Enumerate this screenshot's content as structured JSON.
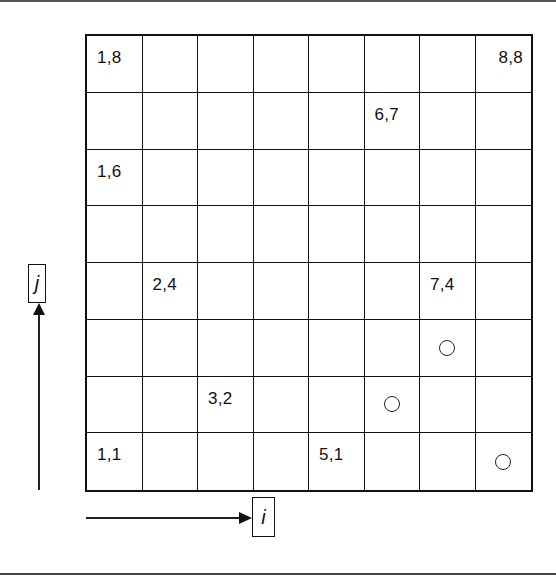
{
  "diagram": {
    "grid": {
      "columns": 8,
      "rows": 8
    },
    "axes": {
      "i": {
        "label": "i",
        "direction": "right"
      },
      "j": {
        "label": "j",
        "direction": "up"
      }
    },
    "labeled_cells": [
      {
        "i": 1,
        "j": 8,
        "text": "1,8"
      },
      {
        "i": 8,
        "j": 8,
        "text": "8,8"
      },
      {
        "i": 6,
        "j": 7,
        "text": "6,7"
      },
      {
        "i": 1,
        "j": 6,
        "text": "1,6"
      },
      {
        "i": 2,
        "j": 4,
        "text": "2,4"
      },
      {
        "i": 7,
        "j": 4,
        "text": "7,4"
      },
      {
        "i": 3,
        "j": 2,
        "text": "3,2"
      },
      {
        "i": 1,
        "j": 1,
        "text": "1,1"
      },
      {
        "i": 5,
        "j": 1,
        "text": "5,1"
      }
    ],
    "circle_markers": [
      {
        "i": 7,
        "j": 3,
        "icon": "circle-icon"
      },
      {
        "i": 6,
        "j": 2,
        "icon": "circle-icon"
      },
      {
        "i": 8,
        "j": 1,
        "icon": "circle-icon"
      }
    ]
  }
}
